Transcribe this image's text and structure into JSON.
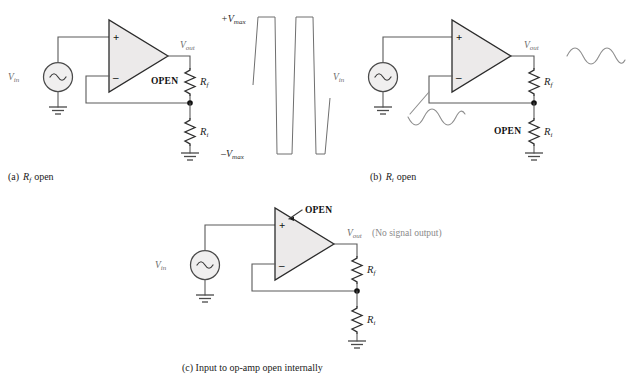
{
  "figure": {
    "background_color": "#ffffff",
    "wire_color": "#5a5a5a",
    "opamp_fill": "#eceaea",
    "label_gray": "#6d6d6d",
    "label_black": "#111111"
  },
  "panels": [
    {
      "id": "a",
      "caption_prefix": "(a)",
      "caption_symbol": "R",
      "caption_subscript": "f",
      "caption_suffix": "open",
      "caption_full": "(a) Rf open",
      "source_label": "V",
      "source_subscript": "in",
      "source_icon": "ac-source-icon",
      "out_label": "V",
      "out_subscript": "out",
      "open_label": "OPEN",
      "open_target": "Rf",
      "rf_label": "R",
      "rf_subscript": "f",
      "ri_label": "R",
      "ri_subscript": "i",
      "plus_label": "+",
      "minus_label": "–",
      "output_waveform": "square-wave-saturated"
    },
    {
      "id": "b",
      "caption_prefix": "(b)",
      "caption_symbol": "R",
      "caption_subscript": "i",
      "caption_suffix": "open",
      "caption_full": "(b) Ri open",
      "source_label": "V",
      "source_subscript": "in",
      "source_icon": "ac-source-icon",
      "out_label": "V",
      "out_subscript": "out",
      "open_label": "OPEN",
      "open_target": "Ri",
      "rf_label": "R",
      "rf_subscript": "f",
      "ri_label": "R",
      "ri_subscript": "i",
      "plus_label": "+",
      "minus_label": "–",
      "output_waveform": "sine-wave",
      "feedback_waveform": "sine-wave"
    },
    {
      "id": "c",
      "caption_prefix": "(c)",
      "caption_full": "(c) Input to op-amp open internally",
      "caption_text": "Input to op-amp open internally",
      "source_label": "V",
      "source_subscript": "in",
      "source_icon": "ac-source-icon",
      "out_label": "V",
      "out_subscript": "out",
      "out_note": "(No signal output)",
      "open_label": "OPEN",
      "open_target": "noninverting-input",
      "rf_label": "R",
      "rf_subscript": "f",
      "ri_label": "R",
      "ri_subscript": "i",
      "plus_label": "+",
      "minus_label": "–",
      "output_waveform": "none"
    }
  ],
  "waveform_plot": {
    "type": "square",
    "ymax_label": "+V",
    "ymax_subscript": "max",
    "ymin_label": "–V",
    "ymin_subscript": "max",
    "description": "Clipped / saturated square wave output swinging between +Vmax and -Vmax"
  }
}
